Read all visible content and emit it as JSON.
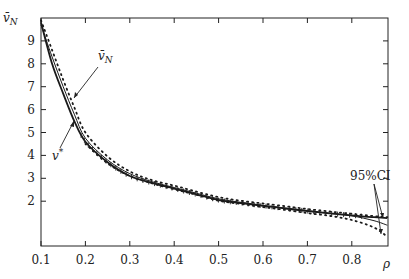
{
  "chart_data": {
    "type": "line",
    "title": "",
    "xlabel": "ρ",
    "ylabel": "v̄N",
    "xlim": [
      0.1,
      0.88
    ],
    "ylim": [
      0,
      10
    ],
    "grid": false,
    "x_ticks": [
      "0.1",
      "0.2",
      "0.3",
      "0.4",
      "0.5",
      "0.6",
      "0.7",
      "0.8"
    ],
    "y_ticks": [
      "2",
      "3",
      "4",
      "5",
      "6",
      "7",
      "8",
      "9"
    ],
    "series": [
      {
        "name": "v*",
        "style": "solid-thick",
        "x": [
          0.1,
          0.125,
          0.15,
          0.175,
          0.2,
          0.25,
          0.3,
          0.35,
          0.4,
          0.45,
          0.5,
          0.55,
          0.6,
          0.65,
          0.7,
          0.75,
          0.8,
          0.85,
          0.88
        ],
        "values": [
          9.8,
          8.0,
          6.7,
          5.5,
          4.6,
          3.7,
          3.1,
          2.8,
          2.55,
          2.3,
          2.05,
          1.92,
          1.8,
          1.68,
          1.57,
          1.47,
          1.38,
          1.3,
          1.26
        ]
      },
      {
        "name": "v̄N",
        "style": "solid-thin",
        "x": [
          0.1,
          0.125,
          0.15,
          0.175,
          0.2,
          0.25,
          0.3,
          0.35,
          0.4,
          0.45,
          0.5,
          0.55,
          0.6,
          0.65,
          0.7,
          0.75,
          0.8,
          0.85,
          0.88
        ],
        "values": [
          9.7,
          8.3,
          7.0,
          5.8,
          4.75,
          3.8,
          3.2,
          2.85,
          2.6,
          2.35,
          2.1,
          1.95,
          1.82,
          1.7,
          1.58,
          1.47,
          1.36,
          1.15,
          0.95
        ]
      },
      {
        "name": "95%CI upper",
        "style": "dotted",
        "x": [
          0.1,
          0.125,
          0.15,
          0.175,
          0.2,
          0.25,
          0.3,
          0.35,
          0.4,
          0.45,
          0.5,
          0.55,
          0.6,
          0.65,
          0.7,
          0.75,
          0.8,
          0.85,
          0.88
        ],
        "values": [
          9.9,
          8.6,
          7.3,
          6.1,
          5.0,
          3.95,
          3.3,
          2.92,
          2.68,
          2.42,
          2.18,
          2.02,
          1.9,
          1.78,
          1.66,
          1.55,
          1.45,
          1.35,
          1.3
        ]
      },
      {
        "name": "95%CI lower",
        "style": "dotted",
        "x": [
          0.2,
          0.25,
          0.3,
          0.35,
          0.4,
          0.45,
          0.5,
          0.55,
          0.6,
          0.65,
          0.7,
          0.75,
          0.8,
          0.85,
          0.88
        ],
        "values": [
          4.5,
          3.65,
          3.1,
          2.78,
          2.52,
          2.28,
          2.02,
          1.88,
          1.74,
          1.62,
          1.48,
          1.36,
          1.18,
          0.85,
          0.45
        ]
      }
    ],
    "annotations": [
      {
        "text": "v̄N",
        "points_to": "v̄N curve near ρ≈0.17"
      },
      {
        "text": "v*",
        "points_to": "v* curve near ρ≈0.17"
      },
      {
        "text": "95%CI",
        "points_to": "CI bands near ρ≈0.87"
      }
    ],
    "markers": "plus markers along v* curve"
  },
  "labels": {
    "y_axis": "v̄",
    "y_axis_sub": "N",
    "x_axis": "ρ",
    "anno_vn": "v̄",
    "anno_vn_sub": "N",
    "anno_vstar": "v",
    "anno_vstar_sup": "*",
    "anno_ci": "95%CI"
  }
}
